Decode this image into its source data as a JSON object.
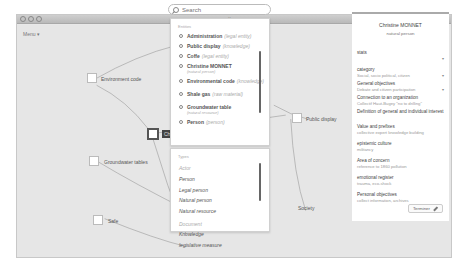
{
  "window": {
    "title": "vertigo.ams",
    "menu_label": "Menu ▾"
  },
  "search": {
    "placeholder": "Search",
    "value": ""
  },
  "search_results": {
    "heading": "Entities",
    "items": [
      {
        "name": "Administration",
        "type": "(legal entity)",
        "sub": ""
      },
      {
        "name": "Public display",
        "type": "(knowledge)",
        "sub": ""
      },
      {
        "name": "Coffe",
        "type": "(legal entity)",
        "sub": ""
      },
      {
        "name": "Christine MONNET",
        "type": "",
        "sub": "(natural person)"
      },
      {
        "name": "Environmental code",
        "type": "(knowledge)",
        "sub": ""
      },
      {
        "name": "Shale gas",
        "type": "(raw material)",
        "sub": ""
      },
      {
        "name": "Groundwater table",
        "type": "",
        "sub": "(natural resource)"
      },
      {
        "name": "Person",
        "type": "(person)",
        "sub": ""
      }
    ]
  },
  "types_list": {
    "heading": "Types",
    "groups": [
      {
        "label": "Actor",
        "entries": [
          "Person",
          "Legal person",
          "Natural person",
          "Natural resource"
        ]
      },
      {
        "label": "Document",
        "entries": [
          "Knowledge",
          "legislative measure"
        ]
      }
    ]
  },
  "graph": {
    "nodes": [
      {
        "id": "environment-code",
        "label": "Environment code"
      },
      {
        "id": "christine",
        "label": "Christine"
      },
      {
        "id": "groundwater-tables",
        "label": "Groundwater tables"
      },
      {
        "id": "safe",
        "label": "Safe"
      },
      {
        "id": "public-display",
        "label": "Public display"
      },
      {
        "id": "society",
        "label": "Society"
      }
    ]
  },
  "detail_panel": {
    "name": "Christine MONNET",
    "type": "natural person",
    "fields": [
      {
        "label": "stats",
        "value": "",
        "dropdown": true
      },
      {
        "label": "category",
        "value": "Social, socio political, citizen",
        "dropdown": true
      },
      {
        "label": "General objectives",
        "value": "Debate and citizen participation",
        "dropdown": true
      },
      {
        "label": "Connection to an organization",
        "value": "Collectif Haut-Bugey \"no to drilling\"",
        "dropdown": false
      },
      {
        "label": "Definition of general and individual interest",
        "value": "",
        "dropdown": false
      },
      {
        "label": "Value and prefixes",
        "value": "collective expert knowledge building",
        "dropdown": false
      },
      {
        "label": "epistemic culture",
        "value": "militancy",
        "dropdown": false
      },
      {
        "label": "Area of concern",
        "value": "reference to 1860 pollution",
        "dropdown": false
      },
      {
        "label": "emotional register",
        "value": "trauma, eco-shock",
        "dropdown": false
      },
      {
        "label": "Personal objectives",
        "value": "collect information, archives",
        "dropdown": false
      }
    ],
    "edit_button": "Terminer"
  }
}
